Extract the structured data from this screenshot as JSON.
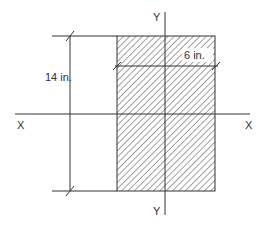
{
  "diagram": {
    "type": "rectangular-cross-section",
    "axes": {
      "x_axis_label_left": "X",
      "x_axis_label_right": "X",
      "y_axis_label_top": "Y",
      "y_axis_label_bottom": "Y"
    },
    "dimensions": {
      "height_label": "14 in.",
      "width_label": "6 in."
    },
    "fill": {
      "pattern": "diagonal-hatch",
      "color": "#555555"
    },
    "line_color": "#333333",
    "background": "#ffffff"
  }
}
